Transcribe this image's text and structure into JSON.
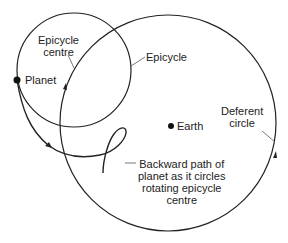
{
  "diagram": {
    "type": "epicycle-model",
    "labels": {
      "epicycle_centre_line1": "Epicycle",
      "epicycle_centre_line2": "centre",
      "epicycle": "Epicycle",
      "planet": "Planet",
      "earth": "Earth",
      "deferent_line1": "Deferent",
      "deferent_line2": "circle",
      "backward_line1": "Backward path of",
      "backward_line2": "planet as it circles",
      "backward_line3": "rotating epicycle",
      "backward_line4": "centre"
    },
    "elements": [
      {
        "name": "epicycle",
        "shape": "circle",
        "cx": 74,
        "cy": 70,
        "r": 57
      },
      {
        "name": "deferent-circle",
        "shape": "circle",
        "cx": 168,
        "cy": 123,
        "r": 108
      },
      {
        "name": "planet",
        "shape": "dot",
        "x": 17,
        "y": 80
      },
      {
        "name": "earth",
        "shape": "dot",
        "x": 168,
        "y": 124
      }
    ],
    "colors": {
      "line": "#222222",
      "background": "#ffffff"
    }
  }
}
